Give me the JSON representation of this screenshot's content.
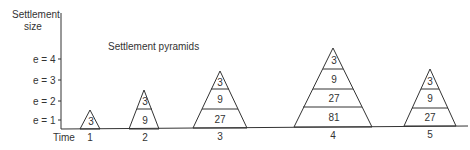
{
  "axis": {
    "y_label_line1": "Settlement",
    "y_label_line2": "size",
    "x_label": "Time",
    "y_ticks": [
      "e = 1",
      "e = 2",
      "e = 3",
      "e = 4"
    ]
  },
  "title": "Settlement pyramids",
  "time_labels": [
    "1",
    "2",
    "3",
    "4",
    "5"
  ],
  "pyramids": [
    {
      "time": "1",
      "tiers": [
        "3"
      ]
    },
    {
      "time": "2",
      "tiers": [
        "3",
        "9"
      ]
    },
    {
      "time": "3",
      "tiers": [
        "3",
        "9",
        "27"
      ]
    },
    {
      "time": "4",
      "tiers": [
        "3",
        "9",
        "27",
        "81"
      ]
    },
    {
      "time": "5",
      "tiers": [
        "3",
        "9",
        "27"
      ]
    }
  ]
}
